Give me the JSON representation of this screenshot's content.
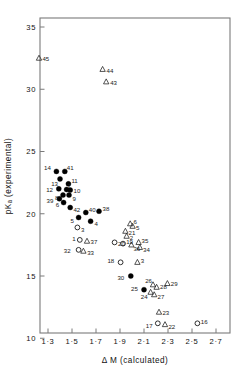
{
  "figure": {
    "type": "scatter-plot",
    "background": "#ffffff",
    "axis_color": "#7a7a7a",
    "marker_color": "#000000"
  },
  "chart_data": {
    "type": "scatter",
    "title": "",
    "xlabel": "Δ M (calculated)",
    "ylabel": "pKₐ (experimental)",
    "xlim": [
      1.2,
      2.8
    ],
    "ylim": [
      10,
      36.2
    ],
    "xticks": [
      1.3,
      1.5,
      1.7,
      1.9,
      2.1,
      2.3,
      2.5,
      2.7
    ],
    "xticklabels": [
      "1·3",
      "1·5",
      "1·7",
      "1·9",
      "2·1",
      "2·3",
      "2·5",
      "2·7"
    ],
    "yticks": [
      10,
      15,
      20,
      25,
      30,
      35
    ],
    "yticklabels": [
      "10",
      "15",
      "20",
      "25",
      "30",
      "35"
    ],
    "grid": false,
    "legend": null,
    "series": [
      {
        "name": "filled-circle",
        "marker": "filled-circle",
        "points": [
          {
            "label": "14",
            "x": 1.37,
            "y": 23.4,
            "lx": -5.5,
            "ly": -4.0
          },
          {
            "label": "41",
            "x": 1.44,
            "y": 23.4,
            "lx": 2.0,
            "ly": -4.0
          },
          {
            "label": "13",
            "x": 1.4,
            "y": 22.8,
            "lx": -2.0,
            "ly": 4.6
          },
          {
            "label": "11",
            "x": 1.47,
            "y": 22.4,
            "lx": 3.0,
            "ly": -3.4
          },
          {
            "label": "12",
            "x": 1.39,
            "y": 22.0,
            "lx": -5.8,
            "ly": 1.2
          },
          {
            "label": "7",
            "x": 1.455,
            "y": 21.95,
            "lx": 1.0,
            "ly": -3.2
          },
          {
            "label": "10",
            "x": 1.485,
            "y": 21.9,
            "lx": 3.4,
            "ly": 0.6
          },
          {
            "label": "9",
            "x": 1.475,
            "y": 21.5,
            "lx": 3.4,
            "ly": 3.4
          },
          {
            "label": "8",
            "x": 1.425,
            "y": 21.5,
            "lx": -4.6,
            "ly": 2.6
          },
          {
            "label": "39",
            "x": 1.395,
            "y": 21.2,
            "lx": -6.0,
            "ly": 2.2
          },
          {
            "label": "6",
            "x": 1.43,
            "y": 20.9,
            "lx": -4.4,
            "ly": 2.4
          },
          {
            "label": "42",
            "x": 1.485,
            "y": 20.5,
            "lx": 3.2,
            "ly": 2.4
          },
          {
            "label": "5",
            "x": 1.555,
            "y": 19.7,
            "lx": -4.8,
            "ly": 3.0
          },
          {
            "label": "40",
            "x": 1.615,
            "y": 20.1,
            "lx": 3.0,
            "ly": -3.0
          },
          {
            "label": "4",
            "x": 1.655,
            "y": 19.4,
            "lx": 4.0,
            "ly": 2.6
          },
          {
            "label": "38",
            "x": 1.725,
            "y": 20.2,
            "lx": 3.6,
            "ly": -2.8
          },
          {
            "label": "30",
            "x": 1.99,
            "y": 15.0,
            "lx": -6.6,
            "ly": 1.6
          },
          {
            "label": "25",
            "x": 2.1,
            "y": 13.9,
            "lx": -6.2,
            "ly": -1.2
          }
        ]
      },
      {
        "name": "open-circle",
        "marker": "open-circle",
        "points": [
          {
            "label": "3",
            "x": 1.545,
            "y": 18.9,
            "lx": 3.6,
            "ly": 2.4
          },
          {
            "label": "1",
            "x": 1.565,
            "y": 17.9,
            "lx": -4.2,
            "ly": -1.0
          },
          {
            "label": "32",
            "x": 1.555,
            "y": 17.1,
            "lx": -8.0,
            "ly": 1.0
          },
          {
            "label": "20",
            "x": 1.855,
            "y": 17.7,
            "lx": 3.4,
            "ly": 1.2
          },
          {
            "label": "19",
            "x": 1.925,
            "y": 17.6,
            "lx": 3.2,
            "ly": -2.0
          },
          {
            "label": "18",
            "x": 1.905,
            "y": 16.1,
            "lx": -6.4,
            "ly": -1.2
          },
          {
            "label": "17",
            "x": 2.215,
            "y": 11.2,
            "lx": -5.2,
            "ly": 2.4
          },
          {
            "label": "16",
            "x": 2.545,
            "y": 11.2,
            "lx": 3.4,
            "ly": -1.6
          }
        ]
      },
      {
        "name": "triangle",
        "marker": "triangle",
        "points": [
          {
            "label": "45",
            "x": 1.225,
            "y": 32.5,
            "lx": 3.4,
            "ly": 1.2
          },
          {
            "label": "44",
            "x": 1.755,
            "y": 31.6,
            "lx": 4.0,
            "ly": 1.4
          },
          {
            "label": "43",
            "x": 1.785,
            "y": 30.6,
            "lx": 4.0,
            "ly": 1.4
          },
          {
            "label": "37",
            "x": 1.625,
            "y": 17.8,
            "lx": 3.6,
            "ly": 0.6
          },
          {
            "label": "33",
            "x": 1.595,
            "y": 17.0,
            "lx": 3.8,
            "ly": 1.8
          },
          {
            "label": "6b",
            "x": 1.985,
            "y": 19.2,
            "lx": 3.2,
            "ly": -1.6,
            "display": "6"
          },
          {
            "label": "5b",
            "x": 2.005,
            "y": 19.0,
            "lx": 3.4,
            "ly": 1.8,
            "display": "5"
          },
          {
            "label": "21",
            "x": 1.945,
            "y": 18.6,
            "lx": 3.2,
            "ly": 1.6
          },
          {
            "label": "2",
            "x": 1.955,
            "y": 18.2,
            "lx": 3.2,
            "ly": 1.8
          },
          {
            "label": "36",
            "x": 1.995,
            "y": 17.5,
            "lx": 2.0,
            "ly": 4.0
          },
          {
            "label": "35",
            "x": 2.055,
            "y": 17.7,
            "lx": 3.0,
            "ly": -1.4
          },
          {
            "label": "34",
            "x": 2.065,
            "y": 17.3,
            "lx": 3.2,
            "ly": 2.6
          },
          {
            "label": "3b",
            "x": 2.045,
            "y": 16.1,
            "lx": 3.4,
            "ly": -1.0,
            "display": "3"
          },
          {
            "label": "26",
            "x": 2.175,
            "y": 14.3,
            "lx": -1.0,
            "ly": -3.4
          },
          {
            "label": "28",
            "x": 2.205,
            "y": 14.1,
            "lx": 3.4,
            "ly": -0.6
          },
          {
            "label": "29",
            "x": 2.295,
            "y": 14.4,
            "lx": 3.4,
            "ly": 0.4
          },
          {
            "label": "27",
            "x": 2.185,
            "y": 13.5,
            "lx": 3.4,
            "ly": 2.2
          },
          {
            "label": "24",
            "x": 2.155,
            "y": 13.7,
            "lx": -3.0,
            "ly": 4.6
          },
          {
            "label": "23",
            "x": 2.225,
            "y": 12.1,
            "lx": 3.4,
            "ly": 0.8
          },
          {
            "label": "22",
            "x": 2.275,
            "y": 11.1,
            "lx": 3.4,
            "ly": 2.4
          }
        ]
      }
    ]
  }
}
